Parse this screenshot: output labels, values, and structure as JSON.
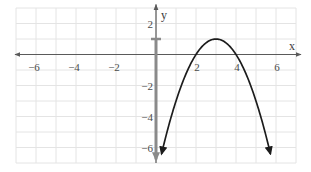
{
  "chart_data": {
    "type": "line",
    "title": "",
    "xlabel": "x",
    "ylabel": "y",
    "xlim": [
      -7,
      7
    ],
    "ylim": [
      -7,
      3
    ],
    "grid": true,
    "grid_step": 1,
    "x_ticks": [
      {
        "value": -6,
        "label": "−6"
      },
      {
        "value": -4,
        "label": "−4"
      },
      {
        "value": -2,
        "label": "−2"
      },
      {
        "value": 2,
        "label": "2"
      },
      {
        "value": 4,
        "label": "4"
      },
      {
        "value": 6,
        "label": "6"
      }
    ],
    "y_ticks": [
      {
        "value": 2,
        "label": "2"
      },
      {
        "value": -2,
        "label": "−2"
      },
      {
        "value": -4,
        "label": "−4"
      },
      {
        "value": -6,
        "label": "−6"
      }
    ],
    "series": [
      {
        "name": "parabola",
        "equation": "y = -(x - 2)(x - 4)",
        "vertex": [
          3,
          1
        ],
        "x_intercepts": [
          2,
          4
        ],
        "domain": [
          0.28,
          5.72
        ],
        "arrows": "both ends (pointing down)",
        "color": "#1c1c1c"
      },
      {
        "name": "range-indicator",
        "description": "Ray drawn along the y-axis from y = 1 (closed bracket) downward",
        "x": 0,
        "from_y": 1,
        "to_y": -6.9,
        "endpoint_style": "closed bracket at y = 1, arrow downward",
        "color": "#8a8a8a"
      }
    ]
  },
  "colors": {
    "background": "#ffffff",
    "grid": "#e4e4e4",
    "axes": "#5a5a5a",
    "curve": "#1c1c1c",
    "range_indicator": "#8a8a8a"
  }
}
